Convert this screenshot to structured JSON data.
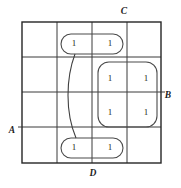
{
  "figure": {
    "type": "karnaugh-map",
    "title": "",
    "variables": [
      "A",
      "B",
      "C",
      "D"
    ],
    "grid": {
      "rows": 4,
      "cols": 4,
      "left": 22,
      "top": 22,
      "right": 161,
      "bottom": 163,
      "x_lines": [
        22,
        57,
        92,
        127,
        161
      ],
      "y_lines": [
        22,
        57,
        92,
        127,
        163
      ]
    },
    "axis_labels": [
      {
        "id": "label-c",
        "text": "C",
        "x": 124,
        "y": 12
      },
      {
        "id": "label-b",
        "text": "B",
        "x": 168,
        "y": 96
      },
      {
        "id": "label-a",
        "text": "A",
        "x": 12,
        "y": 131
      },
      {
        "id": "label-d",
        "text": "D",
        "x": 93,
        "y": 174
      }
    ],
    "cells": [
      {
        "id": "cell-r0c1",
        "value": "1",
        "x": 74,
        "y": 44
      },
      {
        "id": "cell-r0c2",
        "value": "1",
        "x": 110,
        "y": 44
      },
      {
        "id": "cell-r1c2",
        "value": "1",
        "x": 110,
        "y": 79
      },
      {
        "id": "cell-r1c3",
        "value": "1",
        "x": 146,
        "y": 79
      },
      {
        "id": "cell-r2c2",
        "value": "1",
        "x": 110,
        "y": 113
      },
      {
        "id": "cell-r2c3",
        "value": "1",
        "x": 146,
        "y": 113
      },
      {
        "id": "cell-r3c1",
        "value": "1",
        "x": 74,
        "y": 148
      },
      {
        "id": "cell-r3c2",
        "value": "1",
        "x": 110,
        "y": 148
      }
    ],
    "groups": [
      {
        "id": "group-top-pair",
        "shape": "rounded-rect",
        "x": 61,
        "y": 34,
        "width": 62,
        "height": 20,
        "radius": 10
      },
      {
        "id": "group-center-quad",
        "shape": "rounded-rect",
        "x": 98,
        "y": 62,
        "width": 59,
        "height": 65,
        "radius": 11
      },
      {
        "id": "group-bottom-pair",
        "shape": "rounded-rect",
        "x": 61,
        "y": 138,
        "width": 62,
        "height": 20,
        "radius": 10
      }
    ],
    "connector": {
      "id": "wrap-connector",
      "path": "M 75 54 C 66 78, 65 112, 76 138"
    }
  }
}
